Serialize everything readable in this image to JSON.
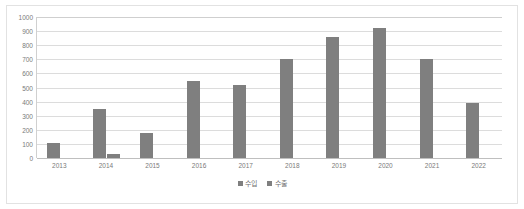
{
  "chart_data": {
    "type": "bar",
    "title": "",
    "subtitle": "",
    "xlabel": "",
    "ylabel": "",
    "categories": [
      "2013",
      "2014",
      "2015",
      "2016",
      "2017",
      "2018",
      "2019",
      "2020",
      "2021",
      "2022"
    ],
    "series": [
      {
        "name": "수입",
        "color": "#7f7f7f",
        "values": [
          110,
          350,
          180,
          545,
          520,
          700,
          860,
          920,
          705,
          390
        ]
      },
      {
        "name": "수출",
        "color": "#7f7f7f",
        "values": [
          0,
          30,
          0,
          0,
          0,
          0,
          0,
          0,
          0,
          0
        ]
      }
    ],
    "ylim": [
      0,
      1000
    ],
    "ytick_step": 100,
    "yticks": [
      "0",
      "100",
      "200",
      "300",
      "400",
      "500",
      "600",
      "700",
      "800",
      "900",
      "1000"
    ],
    "grid": true,
    "legend_position": "bottom",
    "legend_entries": [
      "수입",
      "수출"
    ]
  }
}
